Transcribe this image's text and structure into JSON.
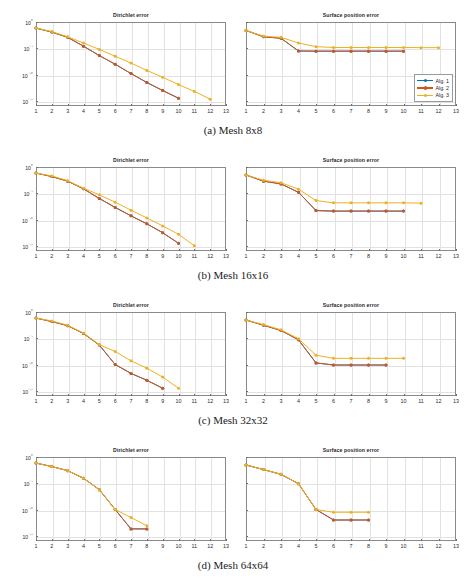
{
  "figure": {
    "titles": {
      "left": "Dirichlet error",
      "right": "Surface position error"
    },
    "legend": [
      {
        "label": "Alg. 1",
        "color": "#0072BD"
      },
      {
        "label": "Alg. 2",
        "color": "#D95319"
      },
      {
        "label": "Alg. 3",
        "color": "#EDB120"
      }
    ],
    "xticks": [
      "1",
      "2",
      "3",
      "4",
      "5",
      "6",
      "7",
      "8",
      "9",
      "10",
      "11",
      "12",
      "13"
    ],
    "yticks": [
      "10⁰",
      "10⁻⁵",
      "10⁻¹⁰",
      "10⁻¹⁵"
    ],
    "captions": {
      "a": "(a) Mesh 8x8",
      "b": "(b) Mesh 16x16",
      "c": "(c) Mesh 32x32",
      "d": "(d) Mesh 64x64"
    }
  },
  "chart_data": [
    {
      "type": "line",
      "title": "Dirichlet error",
      "panel": "(a) Mesh 8x8",
      "xlabel": "",
      "ylabel": "",
      "yscale": "log",
      "xlim": [
        1,
        13
      ],
      "ylim": [
        1e-16,
        1
      ],
      "grid": true,
      "legend_position": "none",
      "x_ticklabels": [
        "1",
        "2",
        "3",
        "4",
        "5",
        "6",
        "7",
        "8",
        "9",
        "10",
        "11",
        "12",
        "13"
      ],
      "y_ticklabels": [
        "10^0",
        "10^-5",
        "10^-10",
        "10^-15"
      ],
      "series": [
        {
          "name": "Alg. 1",
          "color": "#0072BD",
          "x": [
            1,
            2,
            3,
            4,
            5,
            6,
            7,
            8,
            9,
            10
          ],
          "y": [
            0.07,
            0.012,
            0.0012,
            2.5e-05,
            4e-07,
            9e-09,
            1.5e-10,
            3e-12,
            9e-14,
            3e-15
          ]
        },
        {
          "name": "Alg. 2",
          "color": "#D95319",
          "x": [
            1,
            2,
            3,
            4,
            5,
            6,
            7,
            8,
            9,
            10
          ],
          "y": [
            0.07,
            0.012,
            0.0012,
            2.5e-05,
            4e-07,
            9e-09,
            1.5e-10,
            3e-12,
            9e-14,
            3e-15
          ]
        },
        {
          "name": "Alg. 3",
          "color": "#EDB120",
          "x": [
            1,
            2,
            3,
            4,
            5,
            6,
            7,
            8,
            9,
            10,
            11,
            12
          ],
          "y": [
            0.07,
            0.015,
            0.0015,
            0.0001,
            6e-06,
            3e-07,
            1.5e-08,
            6e-10,
            3e-11,
            1.2e-12,
            6e-14,
            2e-15
          ]
        }
      ]
    },
    {
      "type": "line",
      "title": "Surface position error",
      "panel": "(a) Mesh 8x8",
      "xlabel": "",
      "ylabel": "",
      "yscale": "log",
      "xlim": [
        1,
        13
      ],
      "ylim": [
        1e-16,
        1
      ],
      "grid": true,
      "legend_position": "lower right",
      "x_ticklabels": [
        "1",
        "2",
        "3",
        "4",
        "5",
        "6",
        "7",
        "8",
        "9",
        "10",
        "11",
        "12",
        "13"
      ],
      "y_ticklabels": [],
      "series": [
        {
          "name": "Alg. 1",
          "color": "#0072BD",
          "x": [
            1,
            2,
            3,
            4,
            5,
            6,
            7,
            8,
            9,
            10
          ],
          "y": [
            0.025,
            0.0015,
            0.0008,
            3e-06,
            2.8e-06,
            2.8e-06,
            2.8e-06,
            2.8e-06,
            2.8e-06,
            2.8e-06
          ]
        },
        {
          "name": "Alg. 2",
          "color": "#D95319",
          "x": [
            1,
            2,
            3,
            4,
            5,
            6,
            7,
            8,
            9,
            10
          ],
          "y": [
            0.025,
            0.0015,
            0.0008,
            3e-06,
            2.8e-06,
            2.8e-06,
            2.8e-06,
            2.8e-06,
            2.8e-06,
            2.8e-06
          ]
        },
        {
          "name": "Alg. 3",
          "color": "#EDB120",
          "x": [
            1,
            2,
            3,
            4,
            5,
            6,
            7,
            8,
            9,
            10,
            11,
            12
          ],
          "y": [
            0.025,
            0.002,
            0.0012,
            0.0001,
            2e-05,
            1.4e-05,
            1.4e-05,
            1.4e-05,
            1.4e-05,
            1.4e-05,
            1.3e-05,
            1.3e-05
          ]
        }
      ]
    },
    {
      "type": "line",
      "title": "Dirichlet error",
      "panel": "(b) Mesh 16x16",
      "xlabel": "",
      "ylabel": "",
      "yscale": "log",
      "xlim": [
        1,
        13
      ],
      "ylim": [
        1e-16,
        1
      ],
      "grid": true,
      "legend_position": "none",
      "x_ticklabels": [
        "1",
        "2",
        "3",
        "4",
        "5",
        "6",
        "7",
        "8",
        "9",
        "10",
        "11",
        "12",
        "13"
      ],
      "y_ticklabels": [
        "10^0",
        "10^-5",
        "10^-10",
        "10^-15"
      ],
      "series": [
        {
          "name": "Alg. 1",
          "color": "#0072BD",
          "x": [
            1,
            2,
            3,
            4,
            5,
            6,
            7,
            8,
            9,
            10
          ],
          "y": [
            0.07,
            0.015,
            0.002,
            7e-05,
            1e-06,
            2e-08,
            5e-10,
            1.5e-11,
            3e-13,
            3e-15
          ]
        },
        {
          "name": "Alg. 2",
          "color": "#D95319",
          "x": [
            1,
            2,
            3,
            4,
            5,
            6,
            7,
            8,
            9,
            10
          ],
          "y": [
            0.07,
            0.015,
            0.002,
            7e-05,
            1e-06,
            2e-08,
            5e-10,
            1.5e-11,
            3e-13,
            3e-15
          ]
        },
        {
          "name": "Alg. 3",
          "color": "#EDB120",
          "x": [
            1,
            2,
            3,
            4,
            5,
            6,
            7,
            8,
            9,
            10,
            11
          ],
          "y": [
            0.07,
            0.02,
            0.0025,
            9e-05,
            5e-06,
            2e-07,
            6e-09,
            2e-10,
            6e-12,
            1.5e-13,
            1e-15
          ]
        }
      ]
    },
    {
      "type": "line",
      "title": "Surface position error",
      "panel": "(b) Mesh 16x16",
      "xlabel": "",
      "ylabel": "",
      "yscale": "log",
      "xlim": [
        1,
        13
      ],
      "ylim": [
        1e-16,
        1
      ],
      "grid": true,
      "legend_position": "none",
      "x_ticklabels": [
        "1",
        "2",
        "3",
        "4",
        "5",
        "6",
        "7",
        "8",
        "9",
        "10",
        "11",
        "12",
        "13"
      ],
      "y_ticklabels": [],
      "series": [
        {
          "name": "Alg. 1",
          "color": "#0072BD",
          "x": [
            1,
            2,
            3,
            4,
            5,
            6,
            7,
            8,
            9,
            10
          ],
          "y": [
            0.03,
            0.002,
            0.0006,
            1.5e-05,
            5e-09,
            4e-09,
            4e-09,
            4e-09,
            4e-09,
            4e-09
          ]
        },
        {
          "name": "Alg. 2",
          "color": "#D95319",
          "x": [
            1,
            2,
            3,
            4,
            5,
            6,
            7,
            8,
            9,
            10
          ],
          "y": [
            0.03,
            0.002,
            0.0006,
            1.5e-05,
            5e-09,
            4e-09,
            4e-09,
            4e-09,
            4e-09,
            4e-09
          ]
        },
        {
          "name": "Alg. 3",
          "color": "#EDB120",
          "x": [
            1,
            2,
            3,
            4,
            5,
            6,
            7,
            8,
            9,
            10,
            11
          ],
          "y": [
            0.03,
            0.003,
            0.001,
            6e-05,
            4e-07,
            1.5e-07,
            1.5e-07,
            1.5e-07,
            1.5e-07,
            1.5e-07,
            1.3e-07
          ]
        }
      ]
    },
    {
      "type": "line",
      "title": "Dirichlet error",
      "panel": "(c) Mesh 32x32",
      "xlabel": "",
      "ylabel": "",
      "yscale": "log",
      "xlim": [
        1,
        13
      ],
      "ylim": [
        1e-16,
        1
      ],
      "grid": true,
      "legend_position": "none",
      "x_ticklabels": [
        "1",
        "2",
        "3",
        "4",
        "5",
        "6",
        "7",
        "8",
        "9",
        "10",
        "11",
        "12",
        "13"
      ],
      "y_ticklabels": [
        "10^0",
        "10^-5",
        "10^-10",
        "10^-15"
      ],
      "series": [
        {
          "name": "Alg. 1",
          "color": "#0072BD",
          "x": [
            1,
            2,
            3,
            4,
            5,
            6,
            7,
            8,
            9
          ],
          "y": [
            0.07,
            0.015,
            0.0025,
            8e-05,
            5e-07,
            1e-10,
            2e-12,
            1e-13,
            3e-15
          ]
        },
        {
          "name": "Alg. 2",
          "color": "#D95319",
          "x": [
            1,
            2,
            3,
            4,
            5,
            6,
            7,
            8,
            9
          ],
          "y": [
            0.07,
            0.015,
            0.0025,
            8e-05,
            5e-07,
            1e-10,
            2e-12,
            1e-13,
            3e-15
          ]
        },
        {
          "name": "Alg. 3",
          "color": "#EDB120",
          "x": [
            1,
            2,
            3,
            4,
            5,
            6,
            7,
            8,
            9,
            10
          ],
          "y": [
            0.07,
            0.02,
            0.003,
            0.0001,
            6e-07,
            3e-08,
            5e-10,
            2e-11,
            4e-13,
            3e-15
          ]
        }
      ]
    },
    {
      "type": "line",
      "title": "Surface position error",
      "panel": "(c) Mesh 32x32",
      "xlabel": "",
      "ylabel": "",
      "yscale": "log",
      "xlim": [
        1,
        13
      ],
      "ylim": [
        1e-16,
        1
      ],
      "grid": true,
      "legend_position": "none",
      "x_ticklabels": [
        "1",
        "2",
        "3",
        "4",
        "5",
        "6",
        "7",
        "8",
        "9",
        "10",
        "11",
        "12",
        "13"
      ],
      "y_ticklabels": [],
      "series": [
        {
          "name": "Alg. 1",
          "color": "#0072BD",
          "x": [
            1,
            2,
            3,
            4,
            5,
            6,
            7,
            8,
            9
          ],
          "y": [
            0.03,
            0.003,
            0.0003,
            5e-06,
            2e-10,
            8e-11,
            8e-11,
            8e-11,
            8e-11
          ]
        },
        {
          "name": "Alg. 2",
          "color": "#D95319",
          "x": [
            1,
            2,
            3,
            4,
            5,
            6,
            7,
            8,
            9
          ],
          "y": [
            0.03,
            0.003,
            0.0003,
            5e-06,
            2e-10,
            8e-11,
            8e-11,
            8e-11,
            8e-11
          ]
        },
        {
          "name": "Alg. 3",
          "color": "#EDB120",
          "x": [
            1,
            2,
            3,
            4,
            5,
            6,
            7,
            8,
            9,
            10
          ],
          "y": [
            0.03,
            0.004,
            0.0004,
            8e-06,
            6e-09,
            1.5e-09,
            1.5e-09,
            1.5e-09,
            1.5e-09,
            1.5e-09
          ]
        }
      ]
    },
    {
      "type": "line",
      "title": "Dirichlet error",
      "panel": "(d) Mesh 64x64",
      "xlabel": "",
      "ylabel": "",
      "yscale": "log",
      "xlim": [
        1,
        13
      ],
      "ylim": [
        1e-16,
        1
      ],
      "grid": true,
      "legend_position": "none",
      "x_ticklabels": [
        "1",
        "2",
        "3",
        "4",
        "5",
        "6",
        "7",
        "8",
        "9",
        "10",
        "11",
        "12",
        "13"
      ],
      "y_ticklabels": [
        "10^0",
        "10^-5",
        "10^-10",
        "10^-15"
      ],
      "series": [
        {
          "name": "Alg. 1",
          "color": "#0072BD",
          "x": [
            1,
            2,
            3,
            4,
            5,
            6,
            7,
            8
          ],
          "y": [
            0.07,
            0.015,
            0.0025,
            9e-05,
            6e-07,
            1e-10,
            2e-14,
            2e-14
          ]
        },
        {
          "name": "Alg. 2",
          "color": "#D95319",
          "x": [
            1,
            2,
            3,
            4,
            5,
            6,
            7,
            8
          ],
          "y": [
            0.07,
            0.015,
            0.0025,
            9e-05,
            6e-07,
            1e-10,
            2e-14,
            2e-14
          ]
        },
        {
          "name": "Alg. 3",
          "color": "#EDB120",
          "x": [
            1,
            2,
            3,
            4,
            5,
            6,
            7,
            8
          ],
          "y": [
            0.07,
            0.015,
            0.0025,
            9e-05,
            6e-07,
            1e-10,
            3e-12,
            8e-14
          ]
        }
      ]
    },
    {
      "type": "line",
      "title": "Surface position error",
      "panel": "(d) Mesh 64x64",
      "xlabel": "",
      "ylabel": "",
      "yscale": "log",
      "xlim": [
        1,
        13
      ],
      "ylim": [
        1e-16,
        1
      ],
      "grid": true,
      "legend_position": "none",
      "x_ticklabels": [
        "1",
        "2",
        "3",
        "4",
        "5",
        "6",
        "7",
        "8",
        "9",
        "10",
        "11",
        "12",
        "13"
      ],
      "y_ticklabels": [],
      "series": [
        {
          "name": "Alg. 1",
          "color": "#0072BD",
          "x": [
            1,
            2,
            3,
            4,
            5,
            6,
            7,
            8
          ],
          "y": [
            0.03,
            0.004,
            0.0005,
            8e-06,
            1e-10,
            1e-12,
            1e-12,
            1e-12
          ]
        },
        {
          "name": "Alg. 2",
          "color": "#D95319",
          "x": [
            1,
            2,
            3,
            4,
            5,
            6,
            7,
            8
          ],
          "y": [
            0.03,
            0.004,
            0.0005,
            8e-06,
            1e-10,
            1e-12,
            1e-12,
            1e-12
          ]
        },
        {
          "name": "Alg. 3",
          "color": "#EDB120",
          "x": [
            1,
            2,
            3,
            4,
            5,
            6,
            7,
            8
          ],
          "y": [
            0.03,
            0.004,
            0.0005,
            8e-06,
            1e-10,
            3e-11,
            3e-11,
            3e-11
          ]
        }
      ]
    }
  ]
}
